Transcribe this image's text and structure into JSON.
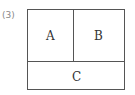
{
  "figure": {
    "number_label": "(3)",
    "regions": [
      {
        "id": "A",
        "label": "A",
        "position": "top-left"
      },
      {
        "id": "B",
        "label": "B",
        "position": "top-right"
      },
      {
        "id": "C",
        "label": "C",
        "position": "bottom-full-width"
      }
    ],
    "line_color": "#555555",
    "text_color": "#333333"
  }
}
